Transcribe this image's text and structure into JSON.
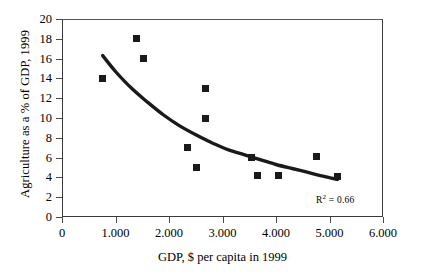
{
  "chart_data": {
    "type": "scatter",
    "title": "",
    "xlabel": "GDP, $ per capita in 1999",
    "ylabel": "Agriculture as a % of GDP, 1999",
    "xlim": [
      0,
      6000
    ],
    "ylim": [
      0,
      20
    ],
    "grid": false,
    "legend": null,
    "x_tick_labels": [
      "0",
      "1.000",
      "2.000",
      "3.000",
      "4.000",
      "5.000",
      "6.000"
    ],
    "x_tick_values": [
      0,
      1000,
      2000,
      3000,
      4000,
      5000,
      6000
    ],
    "y_tick_labels": [
      "0",
      "2",
      "4",
      "6",
      "8",
      "10",
      "12",
      "14",
      "16",
      "18",
      "20"
    ],
    "y_tick_values": [
      0,
      2,
      4,
      6,
      8,
      10,
      12,
      14,
      16,
      18,
      20
    ],
    "points": [
      {
        "x": 750,
        "y": 14.0
      },
      {
        "x": 1400,
        "y": 18.0
      },
      {
        "x": 1530,
        "y": 16.0
      },
      {
        "x": 2340,
        "y": 7.0
      },
      {
        "x": 2520,
        "y": 5.0
      },
      {
        "x": 2690,
        "y": 13.0
      },
      {
        "x": 2690,
        "y": 10.0
      },
      {
        "x": 3550,
        "y": 6.0
      },
      {
        "x": 3660,
        "y": 4.2
      },
      {
        "x": 4040,
        "y": 4.2
      },
      {
        "x": 4750,
        "y": 6.1
      },
      {
        "x": 5150,
        "y": 4.1
      }
    ],
    "trendline": {
      "type": "exponential",
      "label": "R² = 0.66",
      "r_squared": 0.66,
      "points": [
        {
          "x": 760,
          "y": 16.3
        },
        {
          "x": 1000,
          "y": 14.7
        },
        {
          "x": 1300,
          "y": 13.0
        },
        {
          "x": 1600,
          "y": 11.6
        },
        {
          "x": 1900,
          "y": 10.3
        },
        {
          "x": 2200,
          "y": 9.2
        },
        {
          "x": 2500,
          "y": 8.3
        },
        {
          "x": 2800,
          "y": 7.5
        },
        {
          "x": 3100,
          "y": 6.8
        },
        {
          "x": 3400,
          "y": 6.3
        },
        {
          "x": 3700,
          "y": 5.8
        },
        {
          "x": 4000,
          "y": 5.3
        },
        {
          "x": 4300,
          "y": 4.9
        },
        {
          "x": 4600,
          "y": 4.5
        },
        {
          "x": 4900,
          "y": 4.1
        },
        {
          "x": 5150,
          "y": 3.8
        }
      ]
    },
    "colors": {
      "marker": "#1a1a1a",
      "trendline": "#1a1a1a",
      "axis": "#3a3a3a",
      "background": "#ffffff"
    }
  },
  "annotation": {
    "r_squared_prefix": "R",
    "r_squared_exponent": "2",
    "r_squared_value": " = 0.66"
  }
}
